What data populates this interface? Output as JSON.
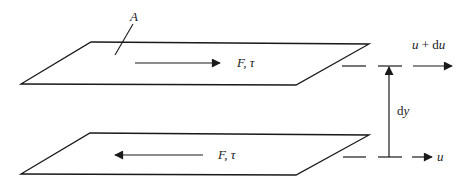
{
  "diagram": {
    "colors": {
      "stroke": "#1a1a1a",
      "background": "#ffffff"
    },
    "labels": {
      "area": "A",
      "top_force": "F, τ",
      "bottom_force": "F, τ",
      "top_velocity": "u + du",
      "bottom_velocity": "u",
      "separation": "dy"
    },
    "elements": {
      "top_plate": {
        "points": [
          [
            21,
            84
          ],
          [
            91,
            42
          ],
          [
            369,
            44
          ],
          [
            296,
            85
          ]
        ]
      },
      "bottom_plate": {
        "points": [
          [
            21,
            174
          ],
          [
            90,
            133
          ],
          [
            369,
            135
          ],
          [
            296,
            175
          ]
        ]
      },
      "top_force_arrow": {
        "from": [
          135,
          63
        ],
        "to": [
          220,
          63
        ],
        "direction": "right"
      },
      "bottom_force_arrow": {
        "from": [
          203,
          155
        ],
        "to": [
          115,
          155
        ],
        "direction": "left"
      },
      "top_velocity_arrow": {
        "from": [
          413,
          66
        ],
        "to": [
          452,
          66
        ],
        "direction": "right"
      },
      "bottom_velocity_arrow": {
        "from": [
          412,
          157
        ],
        "to": [
          432,
          157
        ],
        "direction": "right"
      },
      "dy_dimension": {
        "x": 389,
        "y_bottom": 157,
        "y_top": 66
      }
    }
  }
}
